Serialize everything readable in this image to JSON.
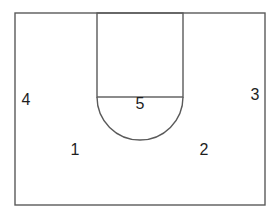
{
  "diagram": {
    "type": "basketball half-court offensive positions",
    "colors": {
      "background": "#ffffff",
      "line": "#5a5a5a",
      "text": "#1e1e1e"
    },
    "court": {
      "boundary": {
        "x": 15,
        "y": 13,
        "width": 250,
        "height": 192
      },
      "lane": {
        "x": 97,
        "y": 13,
        "width": 86,
        "height": 84
      },
      "free_throw_arc": {
        "cx": 140,
        "cy": 97,
        "r": 43
      }
    },
    "positions": [
      {
        "id": "1",
        "label": "1",
        "x": 75,
        "y": 150
      },
      {
        "id": "2",
        "label": "2",
        "x": 204,
        "y": 150
      },
      {
        "id": "3",
        "label": "3",
        "x": 255,
        "y": 95
      },
      {
        "id": "4",
        "label": "4",
        "x": 26,
        "y": 100
      },
      {
        "id": "5",
        "label": "5",
        "x": 140,
        "y": 104
      }
    ]
  }
}
